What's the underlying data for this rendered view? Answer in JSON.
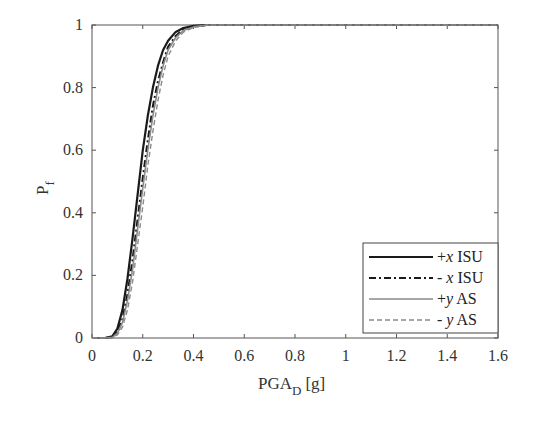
{
  "chart_data": {
    "type": "line",
    "title": "",
    "xlabel": "PGA_D [g]",
    "xlabel_main": "PGA",
    "xlabel_sub": "D",
    "xlabel_unit": "[g]",
    "ylabel": "P_f",
    "ylabel_main": "P",
    "ylabel_sub": "f",
    "xlim": [
      0,
      1.6
    ],
    "ylim": [
      0,
      1
    ],
    "xticks": [
      0,
      0.2,
      0.4,
      0.6,
      0.8,
      1,
      1.2,
      1.4,
      1.6
    ],
    "xtick_labels": [
      "0",
      "0.2",
      "0.4",
      "0.6",
      "0.8",
      "1",
      "1.2",
      "1.4",
      "1.6"
    ],
    "yticks": [
      0,
      0.2,
      0.4,
      0.6,
      0.8,
      1
    ],
    "ytick_labels": [
      "0",
      "0.2",
      "0.4",
      "0.6",
      "0.8",
      "1"
    ],
    "grid": false,
    "legend_position": "lower right",
    "x": [
      0,
      0.05,
      0.08,
      0.1,
      0.12,
      0.14,
      0.16,
      0.18,
      0.2,
      0.22,
      0.24,
      0.26,
      0.28,
      0.3,
      0.33,
      0.36,
      0.4,
      0.45,
      0.5,
      0.6,
      0.8,
      1.0,
      1.2,
      1.4,
      1.6
    ],
    "series": [
      {
        "name": "+x ISU",
        "style": "solid",
        "color": "#1a1a1a",
        "width": 2.2,
        "values": [
          0,
          0,
          0.005,
          0.03,
          0.09,
          0.19,
          0.32,
          0.46,
          0.6,
          0.71,
          0.8,
          0.87,
          0.92,
          0.95,
          0.978,
          0.99,
          0.997,
          1,
          1,
          1,
          1,
          1,
          1,
          1,
          1
        ]
      },
      {
        "name": "- x ISU",
        "style": "dashdot",
        "color": "#1a1a1a",
        "width": 2.2,
        "values": [
          0,
          0,
          0.003,
          0.02,
          0.06,
          0.14,
          0.25,
          0.38,
          0.51,
          0.63,
          0.74,
          0.82,
          0.88,
          0.93,
          0.965,
          0.985,
          0.995,
          1,
          1,
          1,
          1,
          1,
          1,
          1,
          1
        ]
      },
      {
        "name": "+y AS",
        "style": "solid",
        "color": "#8a8a8a",
        "width": 1.6,
        "values": [
          0,
          0,
          0.002,
          0.015,
          0.05,
          0.12,
          0.22,
          0.35,
          0.48,
          0.6,
          0.71,
          0.8,
          0.87,
          0.92,
          0.96,
          0.982,
          0.994,
          1,
          1,
          1,
          1,
          1,
          1,
          1,
          1
        ]
      },
      {
        "name": "- y AS",
        "style": "dashed",
        "color": "#8a8a8a",
        "width": 1.4,
        "values": [
          0,
          0,
          0.001,
          0.01,
          0.035,
          0.09,
          0.18,
          0.3,
          0.42,
          0.55,
          0.66,
          0.76,
          0.84,
          0.9,
          0.95,
          0.977,
          0.992,
          0.999,
          1,
          1,
          1,
          1,
          1,
          1,
          1
        ]
      }
    ]
  },
  "legend": {
    "items": [
      {
        "sign": "+",
        "var": "x",
        "suffix": " ISU"
      },
      {
        "sign": "- ",
        "var": "x",
        "suffix": " ISU"
      },
      {
        "sign": "+",
        "var": "y",
        "suffix": " AS"
      },
      {
        "sign": "- ",
        "var": "y",
        "suffix": " AS"
      }
    ]
  }
}
